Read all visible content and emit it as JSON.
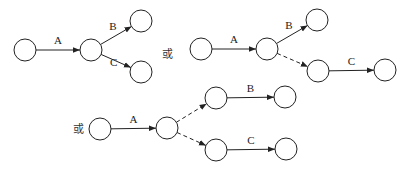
{
  "diagrams": [
    {
      "id": "d1",
      "nodes": [
        {
          "x": 25,
          "y": 50
        },
        {
          "x": 91,
          "y": 50
        },
        {
          "x": 141,
          "y": 21
        },
        {
          "x": 141,
          "y": 72
        }
      ],
      "edges": [
        {
          "from": 0,
          "to": 1,
          "label": "A",
          "dashed": false
        },
        {
          "from": 1,
          "to": 2,
          "label": "B",
          "dashed": false
        },
        {
          "from": 1,
          "to": 3,
          "label": "C",
          "dashed": false
        }
      ]
    },
    {
      "id": "d2",
      "nodes": [
        {
          "x": 201,
          "y": 49
        },
        {
          "x": 267,
          "y": 49
        },
        {
          "x": 317,
          "y": 20
        },
        {
          "x": 318,
          "y": 71
        },
        {
          "x": 385,
          "y": 70
        }
      ],
      "edges": [
        {
          "from": 0,
          "to": 1,
          "label": "A",
          "dashed": false
        },
        {
          "from": 1,
          "to": 2,
          "label": "B",
          "dashed": false
        },
        {
          "from": 1,
          "to": 3,
          "label": "",
          "dashed": true
        },
        {
          "from": 3,
          "to": 4,
          "label": "C",
          "dashed": false
        }
      ]
    },
    {
      "id": "d3",
      "nodes": [
        {
          "x": 100,
          "y": 129
        },
        {
          "x": 167,
          "y": 128
        },
        {
          "x": 216,
          "y": 98
        },
        {
          "x": 285,
          "y": 97
        },
        {
          "x": 216,
          "y": 150
        },
        {
          "x": 286,
          "y": 149
        }
      ],
      "edges": [
        {
          "from": 0,
          "to": 1,
          "label": "A",
          "dashed": false
        },
        {
          "from": 1,
          "to": 2,
          "label": "",
          "dashed": true
        },
        {
          "from": 2,
          "to": 3,
          "label": "B",
          "dashed": false
        },
        {
          "from": 1,
          "to": 4,
          "label": "",
          "dashed": true
        },
        {
          "from": 4,
          "to": 5,
          "label": "C",
          "dashed": false
        }
      ]
    }
  ],
  "or_labels": [
    {
      "text": "或",
      "x": 167,
      "y": 58
    },
    {
      "text": "或",
      "x": 78,
      "y": 133
    }
  ],
  "node_radius": 11
}
